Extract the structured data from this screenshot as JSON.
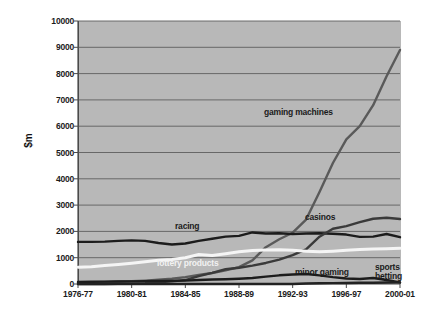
{
  "chart_data": {
    "type": "line",
    "title": "",
    "xlabel": "",
    "ylabel": "$m",
    "ylim": [
      0,
      10000
    ],
    "ytick_labels": [
      "10000",
      "9000",
      "8000",
      "7000",
      "6000",
      "5000",
      "4000",
      "3000",
      "2000",
      "1000",
      "0"
    ],
    "ytick_values": [
      10000,
      9000,
      8000,
      7000,
      6000,
      5000,
      4000,
      3000,
      2000,
      1000,
      0
    ],
    "grid": true,
    "legend_position": "inline-annotations",
    "categories": [
      "1976-77",
      "1977-78",
      "1978-79",
      "1979-80",
      "1980-81",
      "1981-82",
      "1982-83",
      "1983-84",
      "1984-85",
      "1985-86",
      "1986-87",
      "1987-88",
      "1988-89",
      "1989-90",
      "1990-91",
      "1991-92",
      "1992-93",
      "1993-94",
      "1994-95",
      "1995-96",
      "1996-97",
      "1997-98",
      "1998-99",
      "1999-00",
      "2000-01"
    ],
    "xtick_labels": [
      "1976-77",
      "1980-81",
      "1984-85",
      "1988-89",
      "1992-93",
      "1996-97",
      "2000-01"
    ],
    "xtick_indices": [
      0,
      4,
      8,
      12,
      16,
      20,
      24
    ],
    "series": [
      {
        "name": "gaming machines",
        "color": "#5a5a5a",
        "label_x": 264,
        "label_y": 108,
        "values": [
          60,
          70,
          80,
          95,
          110,
          130,
          160,
          200,
          260,
          340,
          420,
          520,
          640,
          900,
          1400,
          1700,
          1950,
          2450,
          3500,
          4600,
          5500,
          6000,
          6800,
          7900,
          8900
        ]
      },
      {
        "name": "racing",
        "color": "#1c1c1c",
        "label_x": 175,
        "label_y": 222,
        "values": [
          1600,
          1600,
          1610,
          1640,
          1660,
          1640,
          1560,
          1500,
          1540,
          1640,
          1720,
          1800,
          1830,
          1960,
          1920,
          1930,
          1900,
          1920,
          1930,
          1910,
          1880,
          1790,
          1800,
          1900,
          1780
        ]
      },
      {
        "name": "casinos",
        "color": "#3a3a3a",
        "label_x": 305,
        "label_y": 213,
        "values": [
          0,
          0,
          0,
          5,
          15,
          30,
          60,
          100,
          150,
          300,
          420,
          560,
          620,
          700,
          800,
          930,
          1100,
          1320,
          1800,
          2100,
          2200,
          2350,
          2480,
          2520,
          2470
        ]
      },
      {
        "name": "lottery products",
        "color": "#f5f5f5",
        "label_x": 157,
        "label_y": 259,
        "values": [
          640,
          660,
          700,
          740,
          790,
          850,
          900,
          930,
          1000,
          1120,
          1080,
          1150,
          1230,
          1270,
          1290,
          1300,
          1280,
          1250,
          1230,
          1250,
          1280,
          1310,
          1330,
          1340,
          1360
        ]
      },
      {
        "name": "minor gaming",
        "color": "#1c1c1c",
        "label_x": 295,
        "label_y": 268,
        "values": [
          80,
          85,
          90,
          95,
          100,
          110,
          115,
          120,
          130,
          150,
          170,
          180,
          200,
          230,
          280,
          330,
          360,
          380,
          330,
          260,
          210,
          190,
          230,
          150,
          60
        ]
      },
      {
        "name": "sports betting",
        "color": "#222222",
        "label_x": 375,
        "label_y": 263,
        "values": [
          0,
          0,
          0,
          0,
          0,
          0,
          0,
          0,
          0,
          0,
          0,
          0,
          0,
          0,
          0,
          0,
          0,
          20,
          30,
          35,
          40,
          45,
          50,
          55,
          60
        ]
      }
    ],
    "annotations": [
      {
        "text": "gaming machines"
      },
      {
        "text": "racing"
      },
      {
        "text": "casinos"
      },
      {
        "text": "lottery products"
      },
      {
        "text": "minor gaming"
      },
      {
        "text": "sports betting"
      }
    ],
    "colors": {
      "plot_background": "#b8b8b8",
      "page_background": "#ffffff",
      "gridline": "#5e5e5e",
      "axis": "#4a4a4a",
      "text": "#1b1b1b"
    }
  }
}
